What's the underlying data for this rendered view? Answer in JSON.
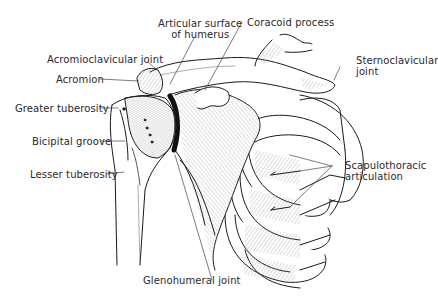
{
  "diagram": {
    "style": "black-and-white anatomical line drawing",
    "colors": {
      "background": "#ffffff",
      "ink": "#1a1a1a",
      "label_text": "#2a2a2a",
      "leader_line": "#444444"
    },
    "labels": {
      "articular_surface_line1": "Articular surface",
      "articular_surface_line2": "of humerus",
      "coracoid_process": "Coracoid process",
      "acromioclavicular_joint": "Acromioclavicular joint",
      "acromion": "Acromion",
      "sternoclavicular_line1": "Sternoclavicular",
      "sternoclavicular_line2": "joint",
      "greater_tuberosity": "Greater tuberosity",
      "bicipital_groove": "Bicipital groove",
      "lesser_tuberosity": "Lesser tuberosity",
      "scapulothoracic_line1": "Scapulothoracic",
      "scapulothoracic_line2": "articulation",
      "glenohumeral_joint": "Glenohumeral joint"
    },
    "structures": [
      "humerus",
      "humeral head",
      "scapula",
      "glenoid",
      "clavicle",
      "acromion",
      "coracoid process",
      "ribs",
      "sternum"
    ]
  }
}
